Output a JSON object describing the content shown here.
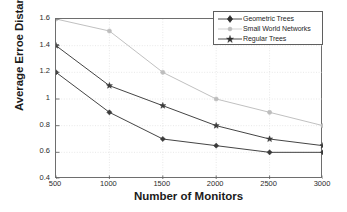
{
  "chart_data": {
    "type": "line",
    "title": "",
    "xlabel": "Number of Monitors",
    "ylabel": "Average Erroe Distance (Hops)",
    "x": [
      500,
      1000,
      1500,
      2000,
      2500,
      3000
    ],
    "xticklabels": [
      "500",
      "1000",
      "1500",
      "2000",
      "2500",
      "3000"
    ],
    "yticklabels": [
      "0.4",
      "0.6",
      "0.8",
      "1",
      "1.2",
      "1.4",
      "1.6"
    ],
    "yticks": [
      0.4,
      0.6,
      0.8,
      1.0,
      1.2,
      1.4,
      1.6
    ],
    "xlim": [
      500,
      3000
    ],
    "ylim": [
      0.4,
      1.6
    ],
    "grid": true,
    "legend_position": "top-right",
    "series": [
      {
        "name": "Geometric Trees",
        "marker": "diamond",
        "color": "#3a3a3a",
        "values": [
          1.2,
          0.9,
          0.7,
          0.65,
          0.6,
          0.6
        ]
      },
      {
        "name": "Small World Networks",
        "marker": "dot",
        "color": "#bdbdbd",
        "values": [
          1.6,
          1.51,
          1.2,
          1.0,
          0.9,
          0.8
        ]
      },
      {
        "name": "Regular Trees",
        "marker": "star",
        "color": "#3a3a3a",
        "values": [
          1.4,
          1.1,
          0.95,
          0.8,
          0.7,
          0.65
        ]
      }
    ]
  },
  "legend": {
    "items": [
      {
        "label": "Geometric Trees"
      },
      {
        "label": "Small World Networks"
      },
      {
        "label": "Regular Trees"
      }
    ]
  }
}
